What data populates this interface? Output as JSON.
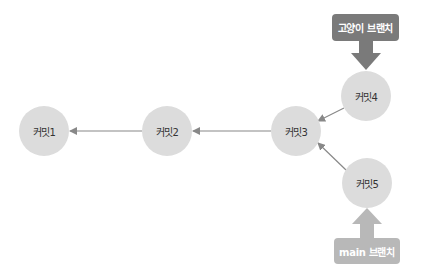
{
  "diagram": {
    "type": "git-branch-graph",
    "commits": [
      {
        "id": "c1",
        "label": "커밋1",
        "cx": 44,
        "cy": 131
      },
      {
        "id": "c2",
        "label": "커밋2",
        "cx": 167,
        "cy": 131
      },
      {
        "id": "c3",
        "label": "커밋3",
        "cx": 296,
        "cy": 131
      },
      {
        "id": "c4",
        "label": "커밋4",
        "cx": 366,
        "cy": 96
      },
      {
        "id": "c5",
        "label": "커밋5",
        "cx": 367,
        "cy": 183
      }
    ],
    "edges": [
      {
        "from": "c2",
        "to": "c1"
      },
      {
        "from": "c3",
        "to": "c2"
      },
      {
        "from": "c4",
        "to": "c3"
      },
      {
        "from": "c5",
        "to": "c3"
      }
    ],
    "branches": [
      {
        "name": "고양이 브랜치",
        "points_to": "c4",
        "color": "#7a7a7a"
      },
      {
        "name": "main 브랜치",
        "points_to": "c5",
        "color": "#b8b8b8"
      }
    ],
    "colors": {
      "node_fill": "#dcdcdc",
      "edge": "#888888",
      "node_text": "#333333"
    }
  }
}
